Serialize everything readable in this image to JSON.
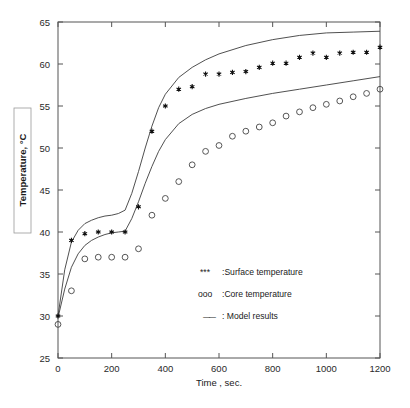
{
  "chart_data": {
    "type": "scatter",
    "title": "",
    "xlabel": "Time , sec.",
    "ylabel": "Temperature, °C",
    "xlim": [
      0,
      1200
    ],
    "ylim": [
      25,
      65
    ],
    "xticks": [
      0,
      200,
      400,
      600,
      800,
      1000,
      1200
    ],
    "yticks": [
      25,
      30,
      35,
      40,
      45,
      50,
      55,
      60,
      65
    ],
    "grid": false,
    "legend_position": "lower-right-inside",
    "series": [
      {
        "name": "Surface temperature",
        "marker": "star",
        "x": [
          0,
          50,
          100,
          150,
          200,
          250,
          300,
          350,
          400,
          450,
          500,
          550,
          600,
          650,
          700,
          750,
          800,
          850,
          900,
          950,
          1000,
          1050,
          1100,
          1150,
          1200
        ],
        "y": [
          30.0,
          39.0,
          39.8,
          40.0,
          40.0,
          40.0,
          43.0,
          52.0,
          55.0,
          57.0,
          57.3,
          58.8,
          58.8,
          59.0,
          59.1,
          59.6,
          60.1,
          60.1,
          60.8,
          61.3,
          60.8,
          61.3,
          61.4,
          61.4,
          62.0
        ]
      },
      {
        "name": "Core temperature",
        "marker": "circle",
        "x": [
          0,
          50,
          100,
          150,
          200,
          250,
          300,
          350,
          400,
          450,
          500,
          550,
          600,
          650,
          700,
          750,
          800,
          850,
          900,
          950,
          1000,
          1050,
          1100,
          1150,
          1200
        ],
        "y": [
          29.0,
          33.0,
          36.8,
          37.0,
          37.0,
          37.0,
          38.0,
          42.0,
          44.0,
          46.0,
          48.0,
          49.6,
          50.3,
          51.4,
          52.0,
          52.5,
          53.0,
          53.8,
          54.3,
          54.8,
          55.2,
          55.6,
          56.1,
          56.5,
          57.0
        ]
      },
      {
        "name": "Model results (surface)",
        "marker": "line",
        "x": [
          0,
          25,
          50,
          75,
          100,
          125,
          150,
          175,
          200,
          225,
          250,
          275,
          300,
          325,
          350,
          375,
          400,
          450,
          500,
          550,
          600,
          700,
          800,
          900,
          1000,
          1100,
          1200
        ],
        "y": [
          30.0,
          35.5,
          38.8,
          40.2,
          41.0,
          41.4,
          41.7,
          41.9,
          42.0,
          42.2,
          42.6,
          44.6,
          47.2,
          50.0,
          52.6,
          54.8,
          56.4,
          58.4,
          59.6,
          60.5,
          61.2,
          62.2,
          62.9,
          63.4,
          63.7,
          63.8,
          63.9
        ]
      },
      {
        "name": "Model results (core)",
        "marker": "line",
        "x": [
          0,
          25,
          50,
          75,
          100,
          125,
          150,
          175,
          200,
          225,
          250,
          275,
          300,
          325,
          350,
          375,
          400,
          450,
          500,
          550,
          600,
          700,
          800,
          900,
          1000,
          1100,
          1200
        ],
        "y": [
          29.8,
          33.2,
          35.8,
          37.4,
          38.4,
          39.0,
          39.4,
          39.7,
          39.9,
          40.0,
          40.1,
          41.6,
          43.6,
          45.8,
          47.8,
          49.6,
          51.0,
          52.9,
          54.0,
          54.7,
          55.2,
          55.9,
          56.5,
          57.0,
          57.5,
          58.0,
          58.5
        ]
      }
    ],
    "legend_entries": [
      {
        "symbol": "***",
        "separator": ":",
        "label": "Surface temperature"
      },
      {
        "symbol": "ooo",
        "separator": ":",
        "label": "Core temperature"
      },
      {
        "symbol": "——",
        "separator": ":",
        "label": "Model results"
      }
    ]
  },
  "axes": {
    "x_tick_labels": [
      "0",
      "200",
      "400",
      "600",
      "800",
      "1000",
      "1200"
    ],
    "y_tick_labels": [
      "25",
      "30",
      "35",
      "40",
      "45",
      "50",
      "55",
      "60",
      "65"
    ],
    "x_axis_title": "Time , sec.",
    "y_axis_title": "Temperature, °C"
  },
  "legend": {
    "line_1_symbol": "***",
    "line_1_label": ":Surface temperature",
    "line_2_symbol": "ooo",
    "line_2_label": ":Core temperature",
    "line_3_symbol": "——",
    "line_3_label": ": Model results"
  },
  "colors": {
    "axis": "#555555",
    "curve": "#3c3c3c",
    "marker_fill": "#111111",
    "marker_stroke": "#444444",
    "background": "#ffffff"
  }
}
